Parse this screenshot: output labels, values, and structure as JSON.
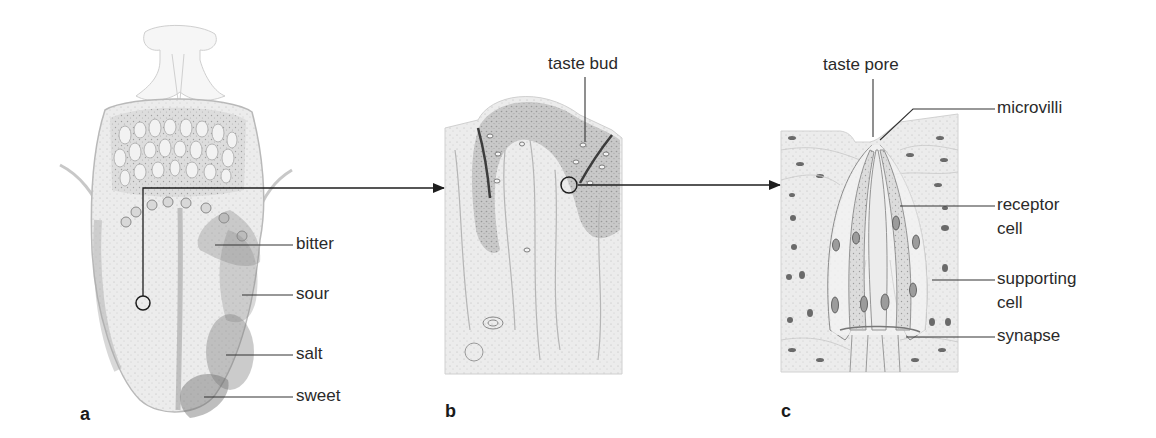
{
  "panels": {
    "a": {
      "letter": "a",
      "subject": "tongue",
      "labels": {
        "bitter": "bitter",
        "sour": "sour",
        "salt": "salt",
        "sweet": "sweet"
      }
    },
    "b": {
      "letter": "b",
      "subject": "papilla cross-section",
      "labels": {
        "taste_bud": "taste bud"
      }
    },
    "c": {
      "letter": "c",
      "subject": "taste bud detail",
      "labels": {
        "taste_pore": "taste pore",
        "microvilli": "microvilli",
        "receptor_cell_1": "receptor",
        "receptor_cell_2": "cell",
        "supporting_cell_1": "supporting",
        "supporting_cell_2": "cell",
        "synapse": "synapse"
      }
    }
  },
  "colors": {
    "line": "#222222",
    "tissue_light": "#e6e6e6",
    "tissue_mid": "#c9c9c9",
    "tissue_dark": "#9a9a9a",
    "zone_overlay": "#8a8a8a"
  }
}
